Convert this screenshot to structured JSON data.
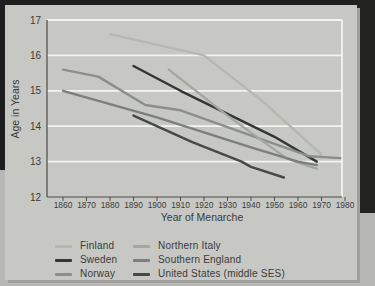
{
  "figure": {
    "background": "#c7c8c4",
    "frame_color": "#1e1e1e",
    "gridline_color": "#f3f4f0",
    "axis_color": "#4a4a48",
    "text_color": "#3a3a38"
  },
  "chart_data": {
    "type": "line",
    "title": "",
    "xlabel": "Year of Menarche",
    "ylabel": "Age in Years",
    "xlim": [
      1855,
      1983
    ],
    "ylim": [
      12,
      17
    ],
    "x_ticks": [
      1860,
      1870,
      1880,
      1890,
      1900,
      1910,
      1920,
      1930,
      1940,
      1950,
      1960,
      1970,
      1980
    ],
    "y_ticks": [
      17,
      16,
      15,
      14,
      13,
      12
    ],
    "grid": "horizontal white gridlines at each year-of-age",
    "legend_position": "below plot, two columns",
    "series": [
      {
        "name": "Finland",
        "color": "#b4b8b0",
        "points": [
          [
            1880,
            16.6
          ],
          [
            1920,
            16.0
          ],
          [
            1945,
            14.7
          ],
          [
            1970,
            13.2
          ]
        ]
      },
      {
        "name": "Sweden",
        "color": "#333537",
        "points": [
          [
            1890,
            15.7
          ],
          [
            1910,
            15.0
          ],
          [
            1950,
            13.7
          ],
          [
            1968,
            13.0
          ]
        ]
      },
      {
        "name": "Norway",
        "color": "#8b8f8c",
        "points": [
          [
            1860,
            15.6
          ],
          [
            1875,
            15.4
          ],
          [
            1895,
            14.6
          ],
          [
            1910,
            14.45
          ],
          [
            1950,
            13.5
          ],
          [
            1965,
            13.15
          ],
          [
            1978,
            13.1
          ]
        ]
      },
      {
        "name": "Northern Italy",
        "color": "#a3a79f",
        "points": [
          [
            1905,
            15.6
          ],
          [
            1930,
            14.3
          ],
          [
            1955,
            13.1
          ],
          [
            1961,
            12.95
          ],
          [
            1968,
            12.8
          ]
        ]
      },
      {
        "name": "Southern England",
        "color": "#7b7f7d",
        "points": [
          [
            1860,
            15.0
          ],
          [
            1900,
            14.25
          ],
          [
            1940,
            13.4
          ],
          [
            1960,
            13.0
          ],
          [
            1968,
            12.9
          ]
        ]
      },
      {
        "name": "United States (middle SES)",
        "color": "#46484a",
        "points": [
          [
            1890,
            14.3
          ],
          [
            1915,
            13.55
          ],
          [
            1936,
            13.0
          ],
          [
            1940,
            12.85
          ],
          [
            1954,
            12.55
          ]
        ]
      }
    ]
  }
}
